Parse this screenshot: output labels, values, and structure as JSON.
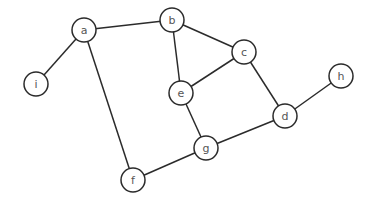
{
  "graph": {
    "type": "undirected",
    "node_radius": 12,
    "nodes": [
      {
        "id": "a",
        "label": "a",
        "x": 84,
        "y": 30
      },
      {
        "id": "b",
        "label": "b",
        "x": 172,
        "y": 20
      },
      {
        "id": "c",
        "label": "c",
        "x": 244,
        "y": 52
      },
      {
        "id": "d",
        "label": "d",
        "x": 285,
        "y": 116
      },
      {
        "id": "e",
        "label": "e",
        "x": 181,
        "y": 93
      },
      {
        "id": "f",
        "label": "f",
        "x": 133,
        "y": 180
      },
      {
        "id": "g",
        "label": "g",
        "x": 206,
        "y": 148
      },
      {
        "id": "h",
        "label": "h",
        "x": 341,
        "y": 76
      },
      {
        "id": "i",
        "label": "i",
        "x": 36,
        "y": 84
      }
    ],
    "edges": [
      {
        "from": "a",
        "to": "b"
      },
      {
        "from": "a",
        "to": "i"
      },
      {
        "from": "a",
        "to": "f"
      },
      {
        "from": "b",
        "to": "e"
      },
      {
        "from": "b",
        "to": "c"
      },
      {
        "from": "c",
        "to": "e"
      },
      {
        "from": "c",
        "to": "d"
      },
      {
        "from": "d",
        "to": "h"
      },
      {
        "from": "d",
        "to": "g"
      },
      {
        "from": "e",
        "to": "g"
      },
      {
        "from": "f",
        "to": "g"
      }
    ]
  }
}
